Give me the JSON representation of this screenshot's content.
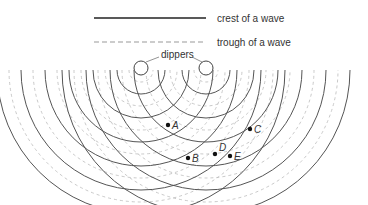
{
  "legend": {
    "crest_label": "crest of a wave",
    "trough_label": "trough of a wave"
  },
  "dippers_label": "dippers",
  "sources": [
    {
      "cx": 141,
      "cy": 68
    },
    {
      "cx": 206,
      "cy": 68
    }
  ],
  "crest_radii": [
    24,
    48,
    72,
    96,
    120,
    144
  ],
  "trough_radii": [
    12,
    36,
    60,
    84,
    108,
    132
  ],
  "points": [
    {
      "label": "A",
      "x": 168,
      "y": 125
    },
    {
      "label": "B",
      "x": 188,
      "y": 158
    },
    {
      "label": "C",
      "x": 250,
      "y": 129
    },
    {
      "label": "D",
      "x": 215,
      "y": 154
    },
    {
      "label": "E",
      "x": 230,
      "y": 156
    }
  ],
  "colors": {
    "line": "#555555",
    "dash": "#bbbbbb",
    "text": "#333333"
  }
}
